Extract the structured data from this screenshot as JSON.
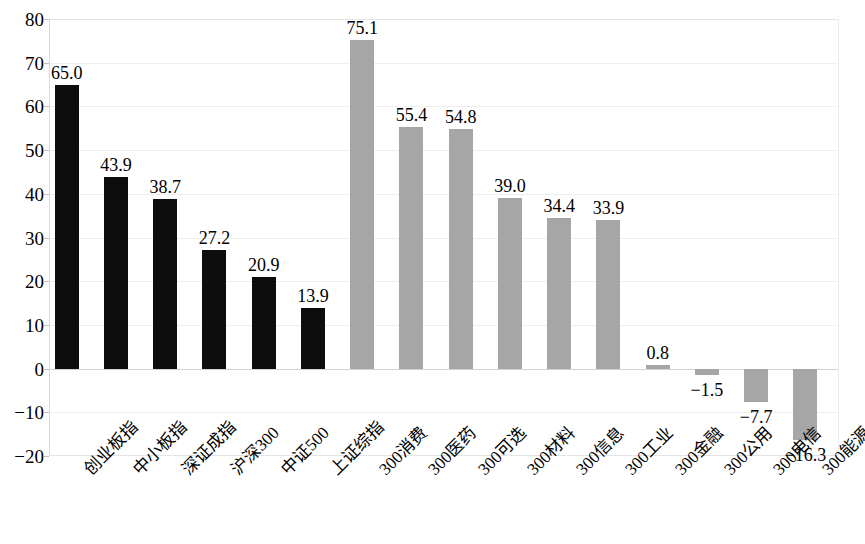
{
  "chart_data": {
    "type": "bar",
    "title": "",
    "subtitle": "",
    "xlabel": "",
    "ylabel": "",
    "ylim": [
      -20,
      80
    ],
    "ytick_values": [
      80,
      70,
      60,
      50,
      40,
      30,
      20,
      10,
      0,
      -10,
      -20
    ],
    "ytick_labels": [
      "80",
      "70",
      "60",
      "50",
      "40",
      "30",
      "20",
      "10",
      "0",
      "−10",
      "−20"
    ],
    "grid": true,
    "legend": "none",
    "categories": [
      "创业板指",
      "中小板指",
      "深证成指",
      "沪深300",
      "中证500",
      "上证综指",
      "300消费",
      "300医药",
      "300可选",
      "300材料",
      "300信息",
      "300工业",
      "300金融",
      "300公用",
      "300电信",
      "300能源"
    ],
    "values": [
      65.0,
      43.9,
      38.7,
      27.2,
      20.9,
      13.9,
      75.1,
      55.4,
      54.8,
      39.0,
      34.4,
      33.9,
      0.8,
      -1.5,
      -7.7,
      -16.3
    ],
    "value_labels": [
      "65.0",
      "43.9",
      "38.7",
      "27.2",
      "20.9",
      "13.9",
      "75.1",
      "55.4",
      "54.8",
      "39.0",
      "34.4",
      "33.9",
      "0.8",
      "−1.5",
      "−7.7",
      "−16.3"
    ],
    "bar_colors": [
      "#0d0d0d",
      "#0d0d0d",
      "#0d0d0d",
      "#0d0d0d",
      "#0d0d0d",
      "#0d0d0d",
      "#a6a6a6",
      "#a6a6a6",
      "#a6a6a6",
      "#a6a6a6",
      "#a6a6a6",
      "#a6a6a6",
      "#a6a6a6",
      "#a6a6a6",
      "#a6a6a6",
      "#a6a6a6"
    ],
    "palette": {
      "index_series": "#0d0d0d",
      "sector_series": "#a6a6a6",
      "gridline": "#efefef",
      "axis": "#d9d9d9",
      "text": "#000000",
      "background": "#ffffff"
    }
  }
}
